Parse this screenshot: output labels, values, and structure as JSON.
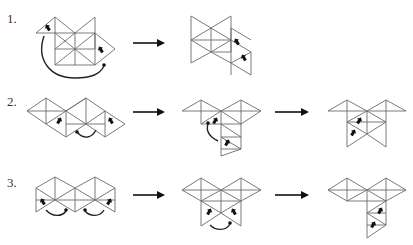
{
  "rows": [
    {
      "label": "1.",
      "label_pos": [
        7,
        14
      ],
      "arrows": [
        [
          133,
          43,
          163,
          43
        ]
      ],
      "figures": [
        {
          "name": "row1-net-start",
          "lines": [
            [
              36,
              33,
              55,
              17
            ],
            [
              55,
              17,
              75,
              33
            ],
            [
              75,
              33,
              36,
              33
            ],
            [
              55,
              17,
              55,
              65
            ],
            [
              75,
              33,
              95,
              17
            ],
            [
              95,
              17,
              95,
              49
            ],
            [
              55,
              49,
              95,
              49
            ],
            [
              55,
              33,
              75,
              49
            ],
            [
              75,
              33,
              75,
              65
            ],
            [
              75,
              33,
              55,
              49
            ],
            [
              95,
              33,
              75,
              49
            ],
            [
              95,
              33,
              115,
              49
            ],
            [
              115,
              49,
              95,
              65
            ],
            [
              95,
              65,
              55,
              65
            ],
            [
              95,
              33,
              95,
              65
            ],
            [
              55,
              65,
              75,
              49
            ],
            [
              75,
              49,
              95,
              65
            ],
            [
              75,
              33,
              95,
              33
            ]
          ],
          "marks": [
            [
              48,
              28,
              -30
            ],
            [
              101,
              50,
              -30
            ]
          ],
          "curves": [
            [
              "M44,36 C36,60 50,78 75,78 C92,78 100,74 104,66"
            ]
          ],
          "curve_heads": [
            [
              104,
              65
            ]
          ]
        },
        {
          "name": "row1-net-result",
          "lines": [
            [
              191,
              16,
              211,
              28
            ],
            [
              211,
              28,
              231,
              16
            ],
            [
              231,
              16,
              231,
              52
            ],
            [
              191,
              16,
              191,
              63
            ],
            [
              191,
              40,
              211,
              28
            ],
            [
              211,
              28,
              211,
              52
            ],
            [
              191,
              40,
              211,
              52
            ],
            [
              211,
              52,
              231,
              40
            ],
            [
              231,
              40,
              211,
              28
            ],
            [
              191,
              63,
              211,
              52
            ],
            [
              211,
              52,
              231,
              63
            ],
            [
              231,
              28,
              251,
              40
            ],
            [
              231,
              40,
              251,
              52
            ],
            [
              251,
              52,
              231,
              63
            ],
            [
              231,
              63,
              251,
              75
            ],
            [
              251,
              52,
              251,
              75
            ],
            [
              191,
              40,
              231,
              40
            ],
            [
              231,
              28,
              231,
              75
            ],
            [
              211,
              52,
              231,
              52
            ]
          ],
          "marks": [
            [
              237,
              42,
              -30
            ],
            [
              244,
              58,
              -30
            ]
          ],
          "curves": [],
          "curve_heads": []
        }
      ]
    },
    {
      "label": "2.",
      "label_pos": [
        7,
        97
      ],
      "arrows": [
        [
          133,
          112,
          163,
          112
        ],
        [
          275,
          112,
          307,
          112
        ]
      ],
      "figures": [
        {
          "name": "row2-net-start",
          "lines": [
            [
              27,
              111,
              46,
              98
            ],
            [
              46,
              98,
              66,
              111
            ],
            [
              66,
              111,
              86,
              98
            ],
            [
              86,
              98,
              105,
              111
            ],
            [
              105,
              111,
              125,
              124
            ],
            [
              27,
              111,
              46,
              124
            ],
            [
              46,
              124,
              66,
              111
            ],
            [
              66,
              111,
              86,
              124
            ],
            [
              86,
              124,
              105,
              111
            ],
            [
              46,
              98,
              46,
              124
            ],
            [
              66,
              111,
              66,
              137
            ],
            [
              86,
              98,
              86,
              124
            ],
            [
              105,
              111,
              105,
              137
            ],
            [
              46,
              124,
              66,
              137
            ],
            [
              66,
              137,
              86,
              124
            ],
            [
              86,
              124,
              105,
              137
            ],
            [
              105,
              137,
              125,
              124
            ],
            [
              27,
              111,
              66,
              111
            ],
            [
              86,
              98,
              66,
              111
            ],
            [
              66,
              124,
              105,
              124
            ]
          ],
          "marks": [
            [
              59,
              121,
              30
            ],
            [
              111,
              121,
              -30
            ]
          ],
          "curves": [
            [
              "M77,132 C84,140 92,138 96,130"
            ]
          ],
          "curve_heads": [
            [
              77,
              132
            ]
          ]
        },
        {
          "name": "row2-net-middle",
          "lines": [
            [
              182,
              111,
              201,
              100
            ],
            [
              201,
              100,
              221,
              111
            ],
            [
              221,
              111,
              241,
              100
            ],
            [
              241,
              100,
              261,
              111
            ],
            [
              182,
              111,
              261,
              111
            ],
            [
              201,
              100,
              201,
              124
            ],
            [
              221,
              111,
              221,
              156
            ],
            [
              241,
              100,
              241,
              124
            ],
            [
              201,
              124,
              221,
              111
            ],
            [
              221,
              111,
              241,
              124
            ],
            [
              201,
              124,
              241,
              124
            ],
            [
              221,
              124,
              241,
              137
            ],
            [
              241,
              124,
              241,
              137
            ],
            [
              221,
              137,
              241,
              137
            ],
            [
              221,
              137,
              241,
              149
            ],
            [
              241,
              137,
              241,
              149
            ],
            [
              221,
              149,
              241,
              149
            ],
            [
              221,
              156,
              241,
              149
            ],
            [
              261,
              111,
              241,
              124
            ]
          ],
          "marks": [
            [
              215,
              121,
              30
            ],
            [
              227,
              143,
              30
            ]
          ],
          "curves": [
            [
              "M218,141 C208,136 206,130 208,124"
            ]
          ],
          "curve_heads": [
            [
              208,
              123
            ]
          ]
        },
        {
          "name": "row2-net-result",
          "lines": [
            [
              328,
              111,
              347,
              100
            ],
            [
              347,
              100,
              367,
              111
            ],
            [
              367,
              111,
              386,
              100
            ],
            [
              386,
              100,
              406,
              111
            ],
            [
              328,
              111,
              406,
              111
            ],
            [
              347,
              100,
              347,
              147
            ],
            [
              367,
              111,
              367,
              134
            ],
            [
              386,
              100,
              386,
              147
            ],
            [
              347,
              122,
              367,
              111
            ],
            [
              367,
              111,
              386,
              122
            ],
            [
              347,
              122,
              386,
              122
            ],
            [
              347,
              122,
              367,
              134
            ],
            [
              367,
              134,
              386,
              122
            ],
            [
              347,
              147,
              367,
              134
            ],
            [
              367,
              134,
              386,
              147
            ]
          ],
          "marks": [
            [
              359,
              121,
              30
            ],
            [
              353,
              133,
              30
            ]
          ],
          "curves": [],
          "curve_heads": []
        }
      ]
    },
    {
      "label": "3.",
      "label_pos": [
        7,
        178
      ],
      "arrows": [
        [
          133,
          195,
          163,
          195
        ],
        [
          275,
          195,
          307,
          195
        ]
      ],
      "figures": [
        {
          "name": "row3-net-start",
          "lines": [
            [
              36,
              188,
              55,
              177
            ],
            [
              55,
              177,
              75,
              188
            ],
            [
              75,
              188,
              95,
              177
            ],
            [
              95,
              177,
              115,
              188
            ],
            [
              36,
              188,
              36,
              212
            ],
            [
              75,
              188,
              75,
              212
            ],
            [
              115,
              188,
              115,
              212
            ],
            [
              55,
              177,
              55,
              200
            ],
            [
              95,
              177,
              95,
              200
            ],
            [
              36,
              188,
              55,
              200
            ],
            [
              55,
              200,
              75,
              188
            ],
            [
              75,
              188,
              95,
              200
            ],
            [
              95,
              200,
              115,
              188
            ],
            [
              36,
              212,
              55,
              200
            ],
            [
              55,
              200,
              75,
              212
            ],
            [
              75,
              212,
              95,
              200
            ],
            [
              95,
              200,
              115,
              212
            ],
            [
              36,
              200,
              75,
              200
            ],
            [
              75,
              200,
              115,
              200
            ]
          ],
          "marks": [
            [
              43,
              202,
              -30
            ],
            [
              109,
              202,
              30
            ]
          ],
          "curves": [
            [
              "M46,210 C52,217 62,217 66,211"
            ],
            [
              "M85,211 C90,217 100,217 104,210"
            ]
          ],
          "curve_heads": [
            [
              66,
              210
            ],
            [
              85,
              210
            ]
          ]
        },
        {
          "name": "row3-net-middle",
          "lines": [
            [
              182,
              190,
              201,
              178
            ],
            [
              201,
              178,
              221,
              190
            ],
            [
              221,
              190,
              241,
              178
            ],
            [
              241,
              178,
              261,
              190
            ],
            [
              182,
              190,
              261,
              190
            ],
            [
              201,
              178,
              201,
              201
            ],
            [
              241,
              178,
              241,
              201
            ],
            [
              221,
              190,
              221,
              213
            ],
            [
              182,
              190,
              201,
              201
            ],
            [
              201,
              201,
              221,
              190
            ],
            [
              221,
              190,
              241,
              201
            ],
            [
              241,
              201,
              261,
              190
            ],
            [
              201,
              201,
              241,
              201
            ],
            [
              201,
              201,
              201,
              226
            ],
            [
              241,
              201,
              241,
              226
            ],
            [
              201,
              226,
              221,
              213
            ],
            [
              221,
              213,
              241,
              226
            ],
            [
              201,
              201,
              221,
              213
            ],
            [
              221,
              213,
              241,
              201
            ]
          ],
          "marks": [
            [
              209,
              212,
              30
            ],
            [
              234,
              212,
              -30
            ]
          ],
          "curves": [
            [
              "M210,225 C216,231 226,231 230,224"
            ]
          ],
          "curve_heads": [
            [
              230,
              223
            ]
          ]
        },
        {
          "name": "row3-net-result",
          "lines": [
            [
              328,
              190,
              347,
              178
            ],
            [
              347,
              178,
              367,
              190
            ],
            [
              367,
              190,
              386,
              178
            ],
            [
              386,
              178,
              406,
              190
            ],
            [
              328,
              190,
              406,
              190
            ],
            [
              347,
              178,
              347,
              201
            ],
            [
              386,
              178,
              386,
              201
            ],
            [
              328,
              190,
              347,
              201
            ],
            [
              347,
              201,
              367,
              190
            ],
            [
              367,
              190,
              386,
              201
            ],
            [
              386,
              201,
              406,
              190
            ],
            [
              347,
              201,
              386,
              201
            ],
            [
              367,
              190,
              367,
              238
            ],
            [
              386,
              201,
              386,
              225
            ],
            [
              367,
              213,
              386,
              201
            ],
            [
              367,
              213,
              386,
              213
            ],
            [
              367,
              213,
              386,
              225
            ],
            [
              386,
              225,
              367,
              238
            ],
            [
              367,
              225,
              386,
              225
            ]
          ],
          "marks": [
            [
              380,
              211,
              30
            ],
            [
              373,
              225,
              30
            ]
          ],
          "curves": [],
          "curve_heads": []
        }
      ]
    }
  ],
  "colors": {
    "edge": "#6b6b6b",
    "mark": "#111111",
    "arrow": "#111111",
    "background": "#ffffff"
  }
}
